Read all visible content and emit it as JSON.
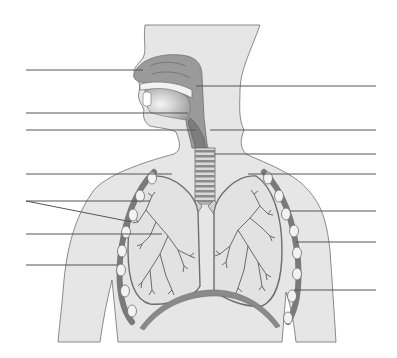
{
  "diagram": {
    "colors": {
      "background": "#ffffff",
      "body_fill": "#e6e6e6",
      "outline": "#6e6e6e",
      "airway_fill": "#9a9a9a",
      "airway_dark": "#7d7d7d",
      "rib_fill": "#7a7a7a",
      "rib_node": "#f2f2f2",
      "leader_line": "#555555",
      "mouth_gradient_inner": "#f6f6f6",
      "mouth_gradient_outer": "#9c9c9c"
    },
    "left_leaders": [
      {
        "id": "L1",
        "y": 70,
        "x1": 26,
        "x2": 143,
        "y2": 70,
        "target": "nasal-cavity"
      },
      {
        "id": "L2",
        "y": 113,
        "x1": 26,
        "x2": 188,
        "y2": 113,
        "target": "mouth"
      },
      {
        "id": "L3",
        "y": 130,
        "x1": 26,
        "x2": 196,
        "y2": 130,
        "target": "larynx"
      },
      {
        "id": "L4",
        "y": 174,
        "x1": 26,
        "x2": 172,
        "y2": 174,
        "target": "pleura"
      },
      {
        "id": "L5a",
        "y": 201,
        "x1": 26,
        "x2": 150,
        "y2": 201,
        "target": "rib"
      },
      {
        "id": "L5b",
        "y": 201,
        "x1": 26,
        "x2": 132,
        "y2": 222,
        "target": "intercostal-muscle"
      },
      {
        "id": "L6",
        "y": 234,
        "x1": 26,
        "x2": 162,
        "y2": 234,
        "target": "bronchus"
      },
      {
        "id": "L7",
        "y": 265,
        "x1": 26,
        "x2": 117,
        "y2": 265,
        "target": "chest-wall"
      }
    ],
    "right_leaders": [
      {
        "id": "R1",
        "y": 86,
        "x1": 196,
        "x2": 376,
        "target": "pharynx"
      },
      {
        "id": "R2",
        "y": 130,
        "x1": 210,
        "x2": 376,
        "target": "epiglottis"
      },
      {
        "id": "R3",
        "y": 154,
        "x1": 214,
        "x2": 376,
        "target": "trachea"
      },
      {
        "id": "R4",
        "y": 174,
        "x1": 248,
        "x2": 376,
        "target": "lung"
      },
      {
        "id": "R5",
        "y": 211,
        "x1": 290,
        "x2": 376,
        "target": "bronchiole"
      },
      {
        "id": "R6",
        "y": 242,
        "x1": 296,
        "x2": 376,
        "target": "intercostal-muscle-right"
      },
      {
        "id": "R7",
        "y": 290,
        "x1": 294,
        "x2": 376,
        "target": "diaphragm"
      }
    ],
    "trachea_rings": 11,
    "rib_nodes_left": [
      [
        152,
        178
      ],
      [
        140,
        196
      ],
      [
        133,
        215
      ],
      [
        126,
        232
      ],
      [
        122,
        251
      ],
      [
        121,
        270
      ],
      [
        125,
        291
      ],
      [
        132,
        311
      ]
    ],
    "rib_nodes_right": [
      [
        268,
        178
      ],
      [
        279,
        196
      ],
      [
        286,
        214
      ],
      [
        294,
        231
      ],
      [
        297,
        253
      ],
      [
        297,
        274
      ],
      [
        292,
        296
      ],
      [
        288,
        318
      ]
    ]
  }
}
